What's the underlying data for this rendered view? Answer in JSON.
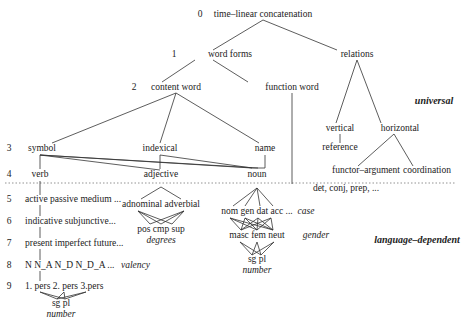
{
  "diagram": {
    "levels": {
      "0": "0",
      "1": "1",
      "2": "2",
      "3": "3",
      "4": "4",
      "5": "5",
      "6": "6",
      "7": "7",
      "8": "8",
      "9": "9"
    },
    "regions": {
      "upper": "universal",
      "lower": "language–dependent"
    },
    "nodes": [
      {
        "id": "root",
        "text": "time–linear concatenation",
        "x": 263,
        "y": 15
      },
      {
        "id": "word_forms",
        "text": "word forms",
        "x": 230,
        "y": 55
      },
      {
        "id": "relations",
        "text": "relations",
        "x": 357,
        "y": 55
      },
      {
        "id": "content_word",
        "text": "content word",
        "x": 176,
        "y": 88
      },
      {
        "id": "function_word",
        "text": "function word",
        "x": 292,
        "y": 88
      },
      {
        "id": "symbol",
        "text": "symbol",
        "x": 42,
        "y": 149
      },
      {
        "id": "indexical",
        "text": "indexical",
        "x": 160,
        "y": 149
      },
      {
        "id": "name",
        "text": "name",
        "x": 265,
        "y": 149
      },
      {
        "id": "vertical",
        "text": "vertical",
        "x": 340,
        "y": 129
      },
      {
        "id": "horizontal",
        "text": "horizontal",
        "x": 400,
        "y": 129
      },
      {
        "id": "reference",
        "text": "reference",
        "x": 340,
        "y": 148
      },
      {
        "id": "functor_argument",
        "text": "functor–argument",
        "x": 366,
        "y": 171
      },
      {
        "id": "coordination",
        "text": "coordination",
        "x": 427,
        "y": 171
      },
      {
        "id": "verb",
        "text": "verb",
        "x": 40,
        "y": 175
      },
      {
        "id": "adjective",
        "text": "adjective",
        "x": 161,
        "y": 175
      },
      {
        "id": "noun",
        "text": "noun",
        "x": 257,
        "y": 175
      },
      {
        "id": "det_conj_prep",
        "text": "det, conj, prep, ...",
        "x": 346,
        "y": 189
      },
      {
        "id": "voice",
        "text": "active  passive  medium ...",
        "x": 25,
        "y": 200,
        "align": "left"
      },
      {
        "id": "adnominal_adverbial",
        "text": "adnominal adverbial",
        "x": 161,
        "y": 205
      },
      {
        "id": "mood",
        "text": "indicative subjunctive...",
        "x": 25,
        "y": 222,
        "align": "left"
      },
      {
        "id": "degree_values",
        "text": "pos cmp sup",
        "x": 161,
        "y": 230
      },
      {
        "id": "degrees",
        "text": "degrees",
        "x": 161,
        "y": 241,
        "style": "italic"
      },
      {
        "id": "case_values",
        "text": "nom gen dat acc ...",
        "x": 257,
        "y": 212
      },
      {
        "id": "case",
        "text": "case",
        "x": 306,
        "y": 212,
        "style": "italic"
      },
      {
        "id": "gender_values",
        "text": "masc fem neut",
        "x": 257,
        "y": 236
      },
      {
        "id": "gender",
        "text": "gender",
        "x": 316,
        "y": 236,
        "style": "italic"
      },
      {
        "id": "noun_number_values",
        "text": "sg pl",
        "x": 257,
        "y": 260
      },
      {
        "id": "noun_number",
        "text": "number",
        "x": 257,
        "y": 271,
        "style": "italic"
      },
      {
        "id": "tense",
        "text": "present imperfect future...",
        "x": 25,
        "y": 244,
        "align": "left"
      },
      {
        "id": "valency_values",
        "text": "N  N_A  N_D  N_D_A ...",
        "x": 25,
        "y": 266,
        "align": "left"
      },
      {
        "id": "valency",
        "text": "valency",
        "x": 121,
        "y": 266,
        "align": "left",
        "style": "italic"
      },
      {
        "id": "person",
        "text": "1. pers 2. pers 3.pers",
        "x": 25,
        "y": 287,
        "align": "left"
      },
      {
        "id": "verb_number_values",
        "text": "sg pl",
        "x": 61,
        "y": 304
      },
      {
        "id": "verb_number",
        "text": "number",
        "x": 61,
        "y": 315,
        "style": "italic"
      }
    ],
    "edges": [
      [
        263,
        20,
        213,
        50
      ],
      [
        263,
        20,
        337,
        50
      ],
      [
        195,
        60,
        162,
        82
      ],
      [
        213,
        60,
        248,
        82
      ],
      [
        176,
        93,
        52,
        143
      ],
      [
        176,
        93,
        160,
        143
      ],
      [
        176,
        93,
        259,
        143
      ],
      [
        292,
        93,
        292,
        184
      ],
      [
        357,
        60,
        336,
        123
      ],
      [
        357,
        60,
        381,
        123
      ],
      [
        340,
        134,
        340,
        143
      ],
      [
        394,
        134,
        358,
        166
      ],
      [
        394,
        134,
        413,
        166
      ],
      [
        40,
        155,
        40,
        169
      ],
      [
        40,
        155,
        160,
        170
      ],
      [
        40,
        155,
        258,
        168
      ],
      [
        40,
        155,
        252,
        168
      ],
      [
        160,
        155,
        160,
        169
      ],
      [
        160,
        155,
        252,
        168
      ],
      [
        265,
        155,
        265,
        168
      ],
      [
        265,
        168,
        252,
        168
      ],
      [
        40,
        181,
        40,
        195
      ],
      [
        161,
        187,
        141,
        199
      ],
      [
        161,
        187,
        181,
        199
      ],
      [
        257,
        188,
        233,
        206
      ],
      [
        257,
        188,
        245,
        206
      ],
      [
        257,
        188,
        260,
        206
      ],
      [
        257,
        188,
        273,
        206
      ],
      [
        40,
        205,
        40,
        216
      ],
      [
        40,
        227,
        40,
        238
      ],
      [
        40,
        249,
        40,
        260
      ],
      [
        40,
        271,
        40,
        281
      ],
      [
        40,
        292,
        57,
        299
      ],
      [
        40,
        292,
        65,
        299
      ],
      [
        64,
        292,
        57,
        299
      ],
      [
        64,
        292,
        65,
        299
      ],
      [
        86,
        292,
        57,
        299
      ],
      [
        86,
        292,
        65,
        299
      ],
      [
        138,
        211,
        150,
        224
      ],
      [
        138,
        211,
        161,
        224
      ],
      [
        138,
        211,
        172,
        224
      ],
      [
        184,
        211,
        150,
        224
      ],
      [
        184,
        211,
        161,
        224
      ],
      [
        184,
        211,
        172,
        224
      ],
      [
        230,
        218,
        241,
        230
      ],
      [
        230,
        218,
        257,
        230
      ],
      [
        230,
        218,
        273,
        230
      ],
      [
        245,
        218,
        241,
        230
      ],
      [
        245,
        218,
        257,
        230
      ],
      [
        245,
        218,
        273,
        230
      ],
      [
        258,
        218,
        241,
        230
      ],
      [
        258,
        218,
        257,
        230
      ],
      [
        258,
        218,
        273,
        230
      ],
      [
        271,
        218,
        241,
        230
      ],
      [
        271,
        218,
        257,
        230
      ],
      [
        271,
        218,
        273,
        230
      ],
      [
        240,
        242,
        252,
        255
      ],
      [
        240,
        242,
        261,
        255
      ],
      [
        257,
        242,
        252,
        255
      ],
      [
        257,
        242,
        261,
        255
      ],
      [
        274,
        242,
        252,
        255
      ],
      [
        274,
        242,
        261,
        255
      ]
    ],
    "level_markers": [
      {
        "n": "0",
        "x": 200,
        "y": 15
      },
      {
        "n": "1",
        "x": 174,
        "y": 55
      },
      {
        "n": "2",
        "x": 134,
        "y": 88
      },
      {
        "n": "3",
        "x": 9,
        "y": 149
      },
      {
        "n": "4",
        "x": 9,
        "y": 175
      },
      {
        "n": "5",
        "x": 9,
        "y": 200
      },
      {
        "n": "6",
        "x": 9,
        "y": 222
      },
      {
        "n": "7",
        "x": 9,
        "y": 244
      },
      {
        "n": "8",
        "x": 9,
        "y": 266
      },
      {
        "n": "9",
        "x": 9,
        "y": 287
      }
    ],
    "region_labels": [
      {
        "key": "upper",
        "x": 434,
        "y": 101
      },
      {
        "key": "lower",
        "x": 417,
        "y": 240
      }
    ],
    "divider": {
      "y": 183,
      "x1": 5,
      "x2": 456
    },
    "colors": {
      "line": "#333333",
      "text": "#222222",
      "divider": "#777777"
    }
  }
}
